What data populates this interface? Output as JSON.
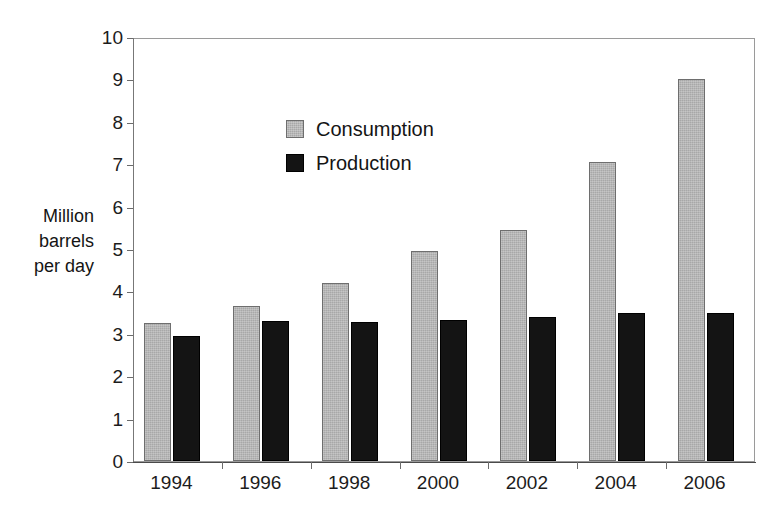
{
  "chart_data": {
    "type": "bar",
    "title": "",
    "subtitle": "",
    "xlabel": "",
    "ylabel": "Million barrels per day",
    "ylabel_lines": [
      "Million",
      "barrels",
      "per day"
    ],
    "categories": [
      "1994",
      "1996",
      "1998",
      "2000",
      "2002",
      "2004",
      "2006"
    ],
    "series": [
      {
        "name": "Consumption",
        "color": "#a8a8a8",
        "values": [
          3.25,
          3.65,
          4.2,
          4.95,
          5.45,
          7.05,
          9.0
        ]
      },
      {
        "name": "Production",
        "color": "#141414",
        "values": [
          2.95,
          3.3,
          3.27,
          3.32,
          3.4,
          3.5,
          3.5
        ]
      }
    ],
    "ylim": [
      0,
      10
    ],
    "ytick_step": 1,
    "yticks": [
      "10",
      "9",
      "8",
      "7",
      "6",
      "5",
      "4",
      "3",
      "2",
      "1",
      "0"
    ],
    "grid": false,
    "legend_position": "top-left",
    "legend_entries": [
      "Consumption",
      "Production"
    ]
  },
  "legend": {
    "consumption_label": "Consumption",
    "production_label": "Production"
  },
  "axes": {
    "y_title_line1": "Million",
    "y_title_line2": "barrels",
    "y_title_line3": "per day"
  }
}
